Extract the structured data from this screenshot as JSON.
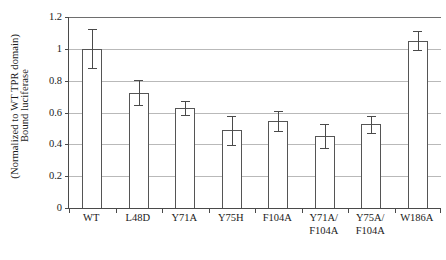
{
  "chart_data": {
    "type": "bar",
    "title": "",
    "xlabel": "",
    "ylabel": "Bound luciferase\n(Normalized to WT TPR domain)",
    "ylabel_line1": "Bound luciferase",
    "ylabel_line2": "(Normalized to WT TPR domain)",
    "categories": [
      "WT",
      "L48D",
      "Y71A",
      "Y75H",
      "F104A",
      "Y71A/\nF104A",
      "Y75A/\nF104A",
      "W186A"
    ],
    "values": [
      1.0,
      0.725,
      0.628,
      0.488,
      0.545,
      0.45,
      0.525,
      1.052
    ],
    "errors": [
      0.122,
      0.08,
      0.043,
      0.09,
      0.063,
      0.075,
      0.053,
      0.06
    ],
    "error_low": [
      0.88,
      0.645,
      0.585,
      0.398,
      0.482,
      0.375,
      0.472,
      0.992
    ],
    "error_high": [
      1.122,
      0.805,
      0.671,
      0.578,
      0.608,
      0.525,
      0.578,
      1.112
    ],
    "ylim": [
      0,
      1.2
    ],
    "yticks": [
      0,
      0.2,
      0.4,
      0.6,
      0.8,
      1,
      1.2
    ],
    "ytick_labels": [
      "0",
      "0.2",
      "0.4",
      "0.6",
      "0.8",
      "1",
      "1.2"
    ],
    "grid": true,
    "grid_axis": "y",
    "legend": null,
    "legend_position": "none",
    "bar_facecolor": "#ffffff",
    "bar_edgecolor": "#555555",
    "errorbar_color": "#4a4a4a",
    "axis_color": "#4a4a4a",
    "gridline_color": "#b9b9b9",
    "background": "#ffffff"
  }
}
